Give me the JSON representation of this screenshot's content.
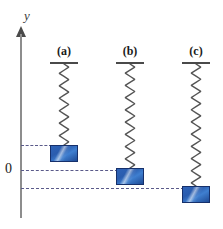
{
  "figure": {
    "type": "physics-diagram",
    "width": 223,
    "height": 229,
    "background_color": "#ffffff"
  },
  "axis": {
    "label": "y",
    "origin_label": "0",
    "orientation": "vertical",
    "arrow_direction": "up",
    "color": "#8d8d8d",
    "x_px": 21,
    "top_px": 28,
    "bottom_px": 218,
    "zero_y_px": 170
  },
  "systems": [
    {
      "label": "(a)",
      "center_x_px": 64,
      "ceiling_y_px": 63,
      "spring_length_px": 81,
      "block_top_y_px": 145,
      "position_relative_to_zero": "above",
      "displacement_px": 25
    },
    {
      "label": "(b)",
      "center_x_px": 130,
      "ceiling_y_px": 63,
      "spring_length_px": 104,
      "block_top_y_px": 168,
      "position_relative_to_zero": "at-zero",
      "displacement_px": 0
    },
    {
      "label": "(c)",
      "center_x_px": 196,
      "ceiling_y_px": 63,
      "spring_length_px": 122,
      "block_top_y_px": 186,
      "position_relative_to_zero": "below",
      "displacement_px": -18
    }
  ],
  "level_lines": [
    {
      "name": "level-line-a",
      "y_px": 145,
      "x_start_px": 21,
      "x_end_px": 52,
      "color": "#5a5a8a"
    },
    {
      "name": "level-line-zero",
      "y_px": 170,
      "x_start_px": 21,
      "x_end_px": 118,
      "color": "#5a5a8a"
    },
    {
      "name": "level-line-c",
      "y_px": 188,
      "x_start_px": 21,
      "x_end_px": 184,
      "color": "#5a5a8a"
    }
  ],
  "block_style": {
    "width_px": 28,
    "height_px": 17,
    "border_color": "#16306b",
    "fill_dark": "#1e4a95",
    "fill_mid": "#2f63b8",
    "fill_light": "#3f7fd0"
  },
  "spring_style": {
    "color": "#555555",
    "coil_width_px": 11,
    "stroke_px": 1.4
  }
}
